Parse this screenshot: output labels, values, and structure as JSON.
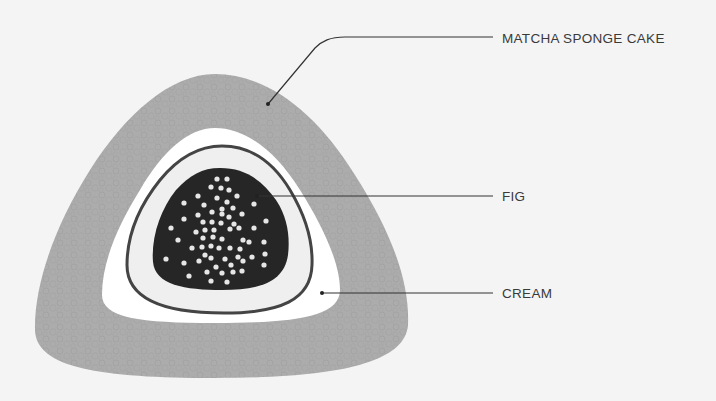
{
  "diagram": {
    "title": "",
    "labels": [
      {
        "id": "matcha",
        "text": "MATCHA SPONGE CAKE",
        "x": 502,
        "y": 32
      },
      {
        "id": "fig",
        "text": "FIG",
        "x": 502,
        "y": 189
      },
      {
        "id": "cream",
        "text": "CREAM",
        "x": 502,
        "y": 286
      }
    ],
    "colors": {
      "background": "#f4f4f4",
      "sponge": "#acacac",
      "cream": "#ffffff",
      "inner_cream": "#efefef",
      "ring": "#444444",
      "fig": "#262626",
      "seeds": "#e6e6e6",
      "leader": "#333333"
    },
    "layers": [
      "MATCHA SPONGE CAKE",
      "CREAM",
      "FIG"
    ]
  }
}
